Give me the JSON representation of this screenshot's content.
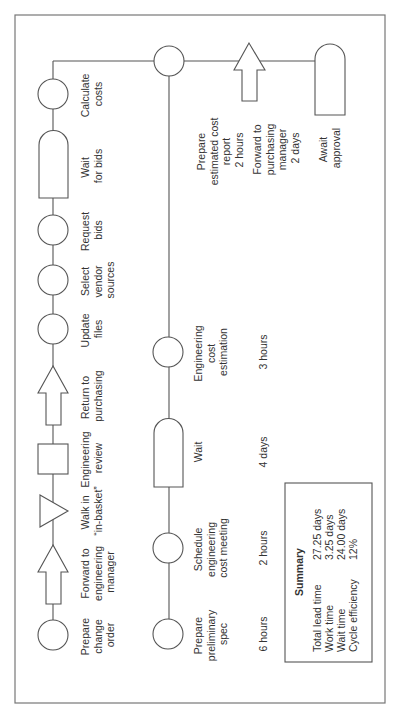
{
  "diagram": {
    "type": "value-stream / process flow chart (rotated 90°)",
    "row1": {
      "steps": [
        {
          "id": "prepare-change-order",
          "shape": "circle",
          "label": [
            "Prepare",
            "change",
            "order"
          ]
        },
        {
          "id": "forward-to-engineering-manager",
          "shape": "arrow",
          "label": [
            "Forward to",
            "engineering",
            "manager"
          ]
        },
        {
          "id": "walk-in-basket",
          "shape": "triangle",
          "label": [
            "Walk in",
            "“in-basket”"
          ]
        },
        {
          "id": "engineering-review",
          "shape": "square",
          "label": [
            "Engineering",
            "review"
          ]
        },
        {
          "id": "return-to-purchasing",
          "shape": "arrow",
          "label": [
            "Return to",
            "purchasing"
          ]
        },
        {
          "id": "update-files",
          "shape": "circle",
          "label": [
            "Update",
            "files"
          ]
        },
        {
          "id": "select-vendor-sources",
          "shape": "circle",
          "label": [
            "Select",
            "vendor",
            "sources"
          ]
        },
        {
          "id": "request-bids",
          "shape": "circle",
          "label": [
            "Request",
            "bids"
          ]
        },
        {
          "id": "wait-for-bids",
          "shape": "delay",
          "label": [
            "Wait",
            "for bids"
          ]
        },
        {
          "id": "calculate-costs",
          "shape": "circle",
          "label": [
            "Calculate",
            "costs"
          ]
        }
      ]
    },
    "row2": {
      "steps": [
        {
          "id": "prepare-preliminary-spec",
          "shape": "circle",
          "label": [
            "Prepare",
            "preliminary",
            "spec"
          ],
          "time": "6 hours"
        },
        {
          "id": "schedule-engineering-cost-meeting",
          "shape": "circle",
          "label": [
            "Schedule",
            "engineering",
            "cost meeting"
          ],
          "time": "2 hours"
        },
        {
          "id": "wait",
          "shape": "delay",
          "label": [
            "Wait"
          ],
          "time": "4 days"
        },
        {
          "id": "engineering-cost-estimation",
          "shape": "circle",
          "label": [
            "Engineering",
            "cost",
            "estimation"
          ],
          "time": "3 hours"
        },
        {
          "id": "prepare-estimated-cost-report",
          "shape": "circle",
          "label": [
            "Prepare",
            "estimated cost",
            "report",
            "2 hours"
          ]
        },
        {
          "id": "forward-to-purchasing-manager",
          "shape": "arrow",
          "label": [
            "Forward to",
            "purchasing",
            "manager",
            "2 days"
          ]
        },
        {
          "id": "await-approval",
          "shape": "delay",
          "label": [
            "Await",
            "approval"
          ]
        }
      ]
    },
    "summary": {
      "title": "Summary",
      "rows": [
        {
          "label": "Total lead time",
          "value": "27.25 days"
        },
        {
          "label": "Work time",
          "value": "3.25 days"
        },
        {
          "label": "Wait time",
          "value": "24.00 days"
        },
        {
          "label": "Cycle efficiency",
          "value": "12%"
        }
      ]
    }
  }
}
